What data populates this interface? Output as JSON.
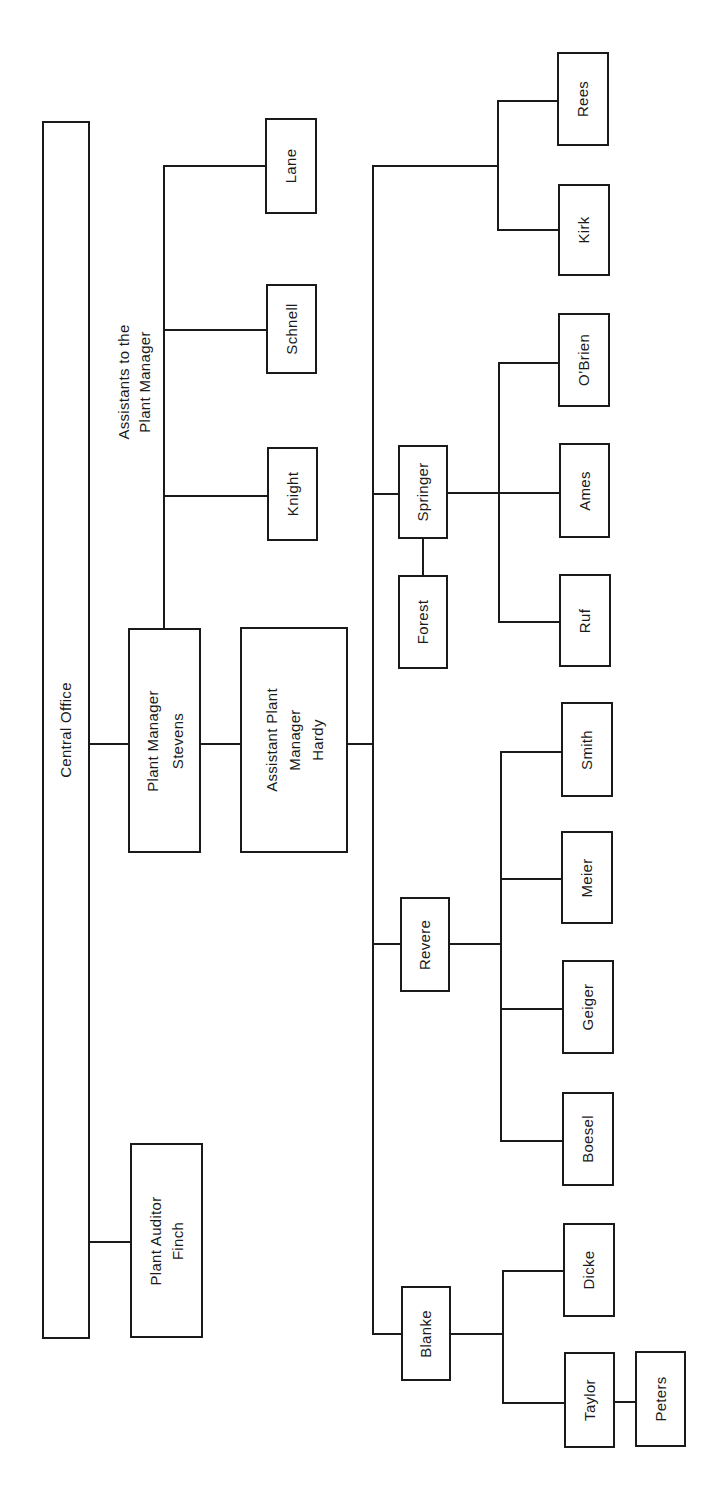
{
  "chart": {
    "title": "",
    "orientation": "rotated-90-ccw"
  },
  "nodes": {
    "central_office": {
      "lines": [
        "Central Office"
      ]
    },
    "plant_auditor": {
      "lines": [
        "Plant Auditor",
        "Finch"
      ]
    },
    "plant_manager": {
      "lines": [
        "Plant Manager",
        "Stevens"
      ]
    },
    "assistant_plant_manager": {
      "lines": [
        "Assistant Plant",
        "Manager",
        "Hardy"
      ]
    },
    "assistants_label": {
      "lines": [
        "Assistants to the",
        "Plant Manager"
      ]
    },
    "knight": {
      "lines": [
        "Knight"
      ]
    },
    "schnell": {
      "lines": [
        "Schnell"
      ]
    },
    "lane": {
      "lines": [
        "Lane"
      ]
    },
    "blanke": {
      "lines": [
        "Blanke"
      ]
    },
    "taylor": {
      "lines": [
        "Taylor"
      ]
    },
    "peters": {
      "lines": [
        "Peters"
      ]
    },
    "dicke": {
      "lines": [
        "Dicke"
      ]
    },
    "revere": {
      "lines": [
        "Revere"
      ]
    },
    "boesel": {
      "lines": [
        "Boesel"
      ]
    },
    "geiger": {
      "lines": [
        "Geiger"
      ]
    },
    "meier": {
      "lines": [
        "Meier"
      ]
    },
    "smith": {
      "lines": [
        "Smith"
      ]
    },
    "springer": {
      "lines": [
        "Springer"
      ]
    },
    "forest": {
      "lines": [
        "Forest"
      ]
    },
    "ruf": {
      "lines": [
        "Ruf"
      ]
    },
    "ames": {
      "lines": [
        "Ames"
      ]
    },
    "obrien": {
      "lines": [
        "O’Brien"
      ]
    },
    "kirk": {
      "lines": [
        "Kirk"
      ]
    },
    "rees": {
      "lines": [
        "Rees"
      ]
    }
  },
  "hierarchy": {
    "Central Office": [
      "Plant Manager Stevens",
      "Plant Auditor Finch"
    ],
    "Plant Manager Stevens": [
      "Assistants to the Plant Manager",
      "Assistant Plant Manager Hardy"
    ],
    "Assistants to the Plant Manager": [
      "Knight",
      "Schnell",
      "Lane"
    ],
    "Assistant Plant Manager Hardy": [
      "Blanke",
      "Revere",
      "Springer"
    ],
    "Blanke": [
      "Taylor",
      "Dicke"
    ],
    "Taylor": [
      "Peters"
    ],
    "Revere": [
      "Boesel",
      "Geiger",
      "Meier",
      "Smith"
    ],
    "Springer": [
      "Forest",
      "Ruf",
      "Ames",
      "O’Brien",
      "Kirk",
      "Rees"
    ]
  },
  "colors": {
    "line": "#1a1a1a",
    "background": "#ffffff"
  }
}
